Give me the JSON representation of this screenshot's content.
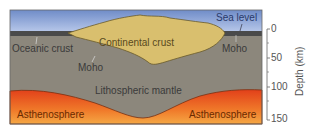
{
  "diagram": {
    "labels": {
      "sea_level": "Sea level",
      "oceanic_crust": "Oceanic crust",
      "continental_crust": "Continental crust",
      "moho_left": "Moho",
      "moho_right": "Moho",
      "lithospheric_mantle": "Lithospheric mantle",
      "asthenosphere_left": "Asthenosphere",
      "asthenosphere_right": "Asthenosphere"
    },
    "axis": {
      "title": "Depth (km)",
      "ticks": [
        "0",
        "50",
        "100",
        "150"
      ]
    },
    "colors": {
      "sea": "#8fa6d8",
      "oceanic_crust": "#4a4a4a",
      "continental_crust": "#d9bf6e",
      "mantle": "#8c877c",
      "asthenosphere_top": "#e8501a",
      "asthenosphere_bottom": "#f4a040"
    }
  }
}
